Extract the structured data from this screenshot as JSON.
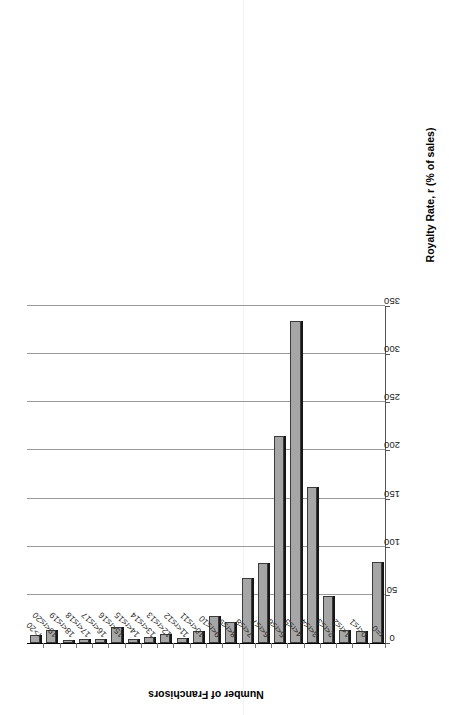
{
  "chart_data": {
    "type": "bar",
    "orientation": "horizontal-rotated",
    "title": "",
    "xlabel": "Royalty Rate, r (% of sales)",
    "ylabel": "Number of Franchisors",
    "ylim": [
      0,
      350
    ],
    "yticks": [
      0,
      50,
      100,
      150,
      200,
      250,
      300,
      350
    ],
    "ytick_labels": [
      "0",
      "50",
      "100",
      "150",
      "200",
      "250",
      "300",
      "350"
    ],
    "grid": true,
    "legend": null,
    "categories": [
      "r=0",
      "0<r≤1",
      "1<r≤2",
      "2<r≤3",
      "3<r≤4",
      "4<r≤5",
      "5<r≤6",
      "6<r≤7",
      "7<r≤8",
      "8<r≤9",
      "9<r≤10",
      "10<r≤11",
      "11<r≤12",
      "12<r≤13",
      "13<r≤14",
      "14<r≤15",
      "15<r≤16",
      "16<r≤17",
      "17<r≤18",
      "18<r≤19",
      "19<r≤20",
      "r>20"
    ],
    "values": [
      84,
      12,
      14,
      49,
      162,
      334,
      215,
      83,
      68,
      22,
      28,
      12,
      5,
      9,
      6,
      4,
      17,
      4,
      4,
      2,
      13,
      8
    ],
    "series": [
      {
        "name": "Number of Franchisors",
        "values": [
          84,
          12,
          14,
          49,
          162,
          334,
          215,
          83,
          68,
          22,
          28,
          12,
          5,
          9,
          6,
          4,
          17,
          4,
          4,
          2,
          13,
          8
        ]
      }
    ],
    "colors": {
      "bar_fill": "#a6a6a6",
      "bar_edge": "#3b3b3b",
      "gridline": "#9a9a9a",
      "axis": "#555555",
      "text": "#000000"
    }
  }
}
